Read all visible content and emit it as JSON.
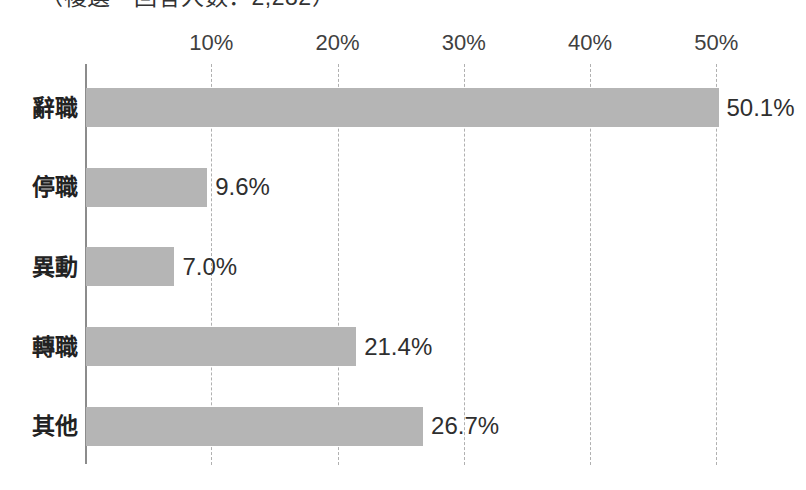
{
  "chart_data": {
    "type": "bar",
    "orientation": "horizontal",
    "title": "（複選・回答人数：2,282）",
    "title_truncated": true,
    "categories": [
      "辭職",
      "停職",
      "異動",
      "轉職",
      "其他"
    ],
    "values": [
      50.1,
      9.6,
      7.0,
      21.4,
      26.7
    ],
    "value_labels": [
      "50.1%",
      "9.6%",
      "7.0%",
      "21.4%",
      "26.7%"
    ],
    "xlabel": "",
    "ylabel": "",
    "xlim": [
      0,
      55
    ],
    "xticks": [
      10,
      20,
      30,
      40,
      50
    ],
    "xtick_labels": [
      "10%",
      "20%",
      "30%",
      "40%",
      "50%"
    ],
    "grid": "vertical-dashed",
    "legend": null,
    "series": [
      {
        "name": "",
        "color": "#b5b5b5",
        "values": [
          50.1,
          9.6,
          7.0,
          21.4,
          26.7
        ]
      }
    ]
  },
  "colors": {
    "bar": "#b5b5b5",
    "axis": "#8c8c8c",
    "gridline": "#b0b0b0",
    "text": "#2f2f2f",
    "background": "#ffffff"
  }
}
